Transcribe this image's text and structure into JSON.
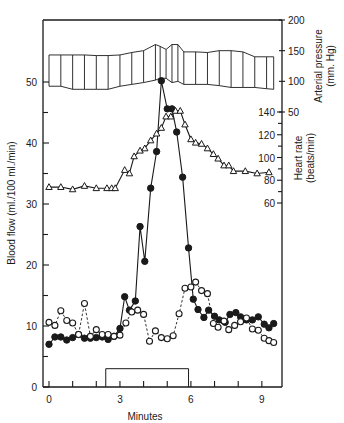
{
  "chart_data": {
    "type": "line",
    "title": "",
    "xlabel": "Minutes",
    "x_ticks": [
      0,
      3,
      6,
      9
    ],
    "x_minor_ticks": [
      0,
      1,
      2,
      3,
      4,
      5,
      6,
      7,
      8,
      9
    ],
    "xlim": [
      -0.3,
      9.8
    ],
    "left_axis": {
      "label": "Blood flow (ml./100 ml./min)",
      "ticks": [
        0,
        10,
        20,
        30,
        40,
        50
      ],
      "minor_ticks": [
        5,
        15,
        25,
        35,
        45
      ],
      "ylim": [
        0,
        55
      ]
    },
    "right_axis_pressure": {
      "label": "Arterial pressure (mm. Hg)",
      "ticks": [
        50,
        100,
        150,
        200
      ],
      "range": [
        50,
        200
      ]
    },
    "right_axis_heart_rate": {
      "label": "Heart rate (beats/min)",
      "ticks": [
        60,
        80,
        100,
        120,
        140
      ],
      "minor_ticks": [
        70,
        90,
        110,
        130
      ],
      "range": [
        50,
        140
      ]
    },
    "stimulus_bar": {
      "x_start": 2.4,
      "x_end": 5.9,
      "height": 3
    },
    "series": [
      {
        "name": "Blood flow (filled circles)",
        "axis": "left",
        "marker": "filled-circle",
        "line": "solid",
        "x": [
          0,
          0.25,
          0.5,
          0.75,
          1.0,
          1.25,
          1.5,
          1.75,
          2.0,
          2.25,
          2.5,
          2.75,
          3.0,
          3.2,
          3.4,
          3.65,
          3.85,
          4.05,
          4.3,
          4.55,
          4.75,
          5.0,
          5.2,
          5.4,
          5.65,
          5.9,
          6.1,
          6.3,
          6.55,
          6.75,
          7.0,
          7.2,
          7.45,
          7.65,
          7.9,
          8.1,
          8.35,
          8.6,
          8.85,
          9.1,
          9.3,
          9.5
        ],
        "y": [
          7,
          8.2,
          8.2,
          7.7,
          8.1,
          8.6,
          8,
          8,
          8.1,
          8.2,
          7.8,
          8.3,
          9.6,
          14.8,
          12.6,
          14.1,
          26.3,
          20.6,
          32.6,
          38.6,
          50.2,
          45.6,
          45.6,
          41.8,
          34.4,
          22.8,
          14.4,
          12.7,
          11.4,
          12.6,
          11.6,
          11.0,
          10.6,
          11.9,
          12.2,
          11.5,
          11.0,
          11.0,
          11.5,
          10.3,
          9.7,
          10.4
        ]
      },
      {
        "name": "Blood flow (open circles)",
        "axis": "left",
        "marker": "open-circle",
        "line": "dashed",
        "x": [
          0,
          0.25,
          0.5,
          0.75,
          1.0,
          1.25,
          1.5,
          1.75,
          2.0,
          2.25,
          2.5,
          2.75,
          3.0,
          3.25,
          3.5,
          3.75,
          4.0,
          4.25,
          4.5,
          4.75,
          5.0,
          5.25,
          5.5,
          5.75,
          6.0,
          6.2,
          6.45,
          6.7,
          6.95,
          7.15,
          7.4,
          7.6,
          7.85,
          8.1,
          8.35,
          8.6,
          8.85,
          9.1,
          9.3,
          9.5
        ],
        "y": [
          10.6,
          10.1,
          12.5,
          10.9,
          10.5,
          8.6,
          13.7,
          8.3,
          9.4,
          8.6,
          8.6,
          8.3,
          8.5,
          10.5,
          12.3,
          12.6,
          11.9,
          7.5,
          9.2,
          8.1,
          7.9,
          8.4,
          12.0,
          16.2,
          16.4,
          17.2,
          15.8,
          15.3,
          10.4,
          9.8,
          10.8,
          9.4,
          10.1,
          10.7,
          11.3,
          9.5,
          9.3,
          8.0,
          7.6,
          7.3
        ]
      },
      {
        "name": "Heart rate (open triangles)",
        "axis": "right_heart_rate",
        "marker": "open-triangle",
        "line": "solid",
        "x": [
          0,
          0.5,
          1.0,
          1.5,
          2.0,
          2.45,
          2.65,
          2.8,
          3.2,
          3.4,
          3.6,
          3.85,
          4.05,
          4.3,
          4.55,
          4.75,
          4.95,
          5.15,
          5.35,
          5.55,
          5.75,
          6.0,
          6.2,
          6.45,
          6.7,
          6.95,
          7.15,
          7.4,
          7.6,
          7.8,
          8.3,
          8.8,
          9.3
        ],
        "y": [
          74,
          74,
          72,
          75,
          73,
          73,
          73,
          73,
          89,
          86,
          101,
          106,
          108,
          115,
          121,
          126,
          136,
          136,
          141,
          141,
          129,
          116,
          113,
          112,
          108,
          103,
          99,
          93,
          93,
          88,
          88,
          86,
          87
        ]
      },
      {
        "name": "Arterial pressure band (systolic/diastolic)",
        "axis": "right_pressure",
        "marker": "band",
        "x": [
          0,
          0.5,
          1.0,
          1.5,
          2.0,
          2.5,
          3.0,
          3.5,
          4.0,
          4.5,
          4.7,
          4.95,
          5.2,
          5.45,
          5.7,
          6.2,
          6.7,
          7.2,
          7.7,
          8.2,
          8.7,
          9.2,
          9.5
        ],
        "systolic": [
          143,
          143,
          143,
          143,
          142,
          142,
          143,
          147,
          150,
          160,
          157,
          152,
          160,
          160,
          148,
          148,
          147,
          150,
          150,
          148,
          140,
          140,
          140
        ],
        "diastolic": [
          92,
          92,
          87,
          87,
          87,
          87,
          92,
          95,
          98,
          102,
          105,
          105,
          98,
          100,
          95,
          95,
          95,
          93,
          90,
          90,
          90,
          88,
          87
        ]
      }
    ]
  }
}
